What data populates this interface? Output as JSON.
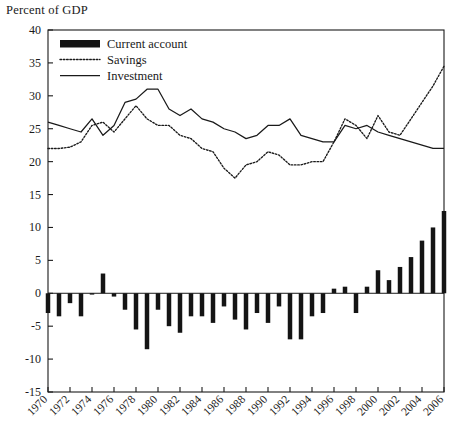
{
  "axis_label": "Percent of GDP",
  "caption": "",
  "legend": {
    "items": [
      {
        "label": "Current account",
        "marker": "bar-swatch"
      },
      {
        "label": "Savings",
        "marker": "dotted-line"
      },
      {
        "label": "Investment",
        "marker": "solid-line"
      }
    ]
  },
  "chart_data": {
    "type": "bar",
    "title": "",
    "subtitle": "",
    "xlabel": "",
    "ylabel": "Percent of GDP",
    "ylim": [
      -15,
      40
    ],
    "ytick_step": 5,
    "yticks": [
      -15,
      -10,
      -5,
      0,
      5,
      10,
      15,
      20,
      25,
      30,
      35,
      40
    ],
    "ytick_labels": [
      "-15",
      "-10",
      "-5",
      "0",
      "5",
      "10",
      "15",
      "20",
      "25",
      "30",
      "35",
      "40"
    ],
    "xlim": [
      1970,
      2006
    ],
    "x": [
      1970,
      1971,
      1972,
      1973,
      1974,
      1975,
      1976,
      1977,
      1978,
      1979,
      1980,
      1981,
      1982,
      1983,
      1984,
      1985,
      1986,
      1987,
      1988,
      1989,
      1990,
      1991,
      1992,
      1993,
      1994,
      1995,
      1996,
      1997,
      1998,
      1999,
      2000,
      2001,
      2002,
      2003,
      2004,
      2005,
      2006
    ],
    "xticks": [
      1970,
      1972,
      1974,
      1976,
      1978,
      1980,
      1982,
      1984,
      1986,
      1988,
      1990,
      1992,
      1994,
      1996,
      1998,
      2000,
      2002,
      2004,
      2006
    ],
    "xtick_labels": [
      "1970",
      "1972",
      "1974",
      "1976",
      "1978",
      "1980",
      "1982",
      "1984",
      "1986",
      "1988",
      "1990",
      "1992",
      "1994",
      "1996",
      "1998",
      "2000",
      "2002",
      "2004",
      "2006"
    ],
    "xtick_rotation": 45,
    "grid": false,
    "legend_position": "upper-left",
    "series": [
      {
        "name": "Current account",
        "type": "bar",
        "color": "#141414",
        "values": [
          -3.0,
          -3.5,
          -1.5,
          -3.5,
          -0.2,
          3.0,
          -0.5,
          -2.5,
          -5.5,
          -8.5,
          -2.5,
          -5.0,
          -6.0,
          -3.5,
          -3.5,
          -4.5,
          -2.0,
          -4.0,
          -5.5,
          -3.0,
          -4.5,
          -2.0,
          -7.0,
          -7.0,
          -3.5,
          -3.0,
          0.7,
          1.0,
          -3.0,
          1.0,
          3.5,
          2.0,
          4.0,
          5.5,
          8.0,
          10.0,
          12.5
        ]
      },
      {
        "name": "Savings",
        "type": "line",
        "style": "dotted",
        "color": "#1a1a1a",
        "values": [
          22.0,
          22.0,
          22.2,
          23.0,
          25.5,
          26.0,
          24.5,
          26.5,
          28.5,
          26.5,
          25.5,
          25.5,
          24.0,
          23.5,
          22.0,
          21.5,
          19.0,
          17.5,
          19.5,
          20.0,
          21.5,
          21.0,
          19.5,
          19.5,
          20.0,
          20.0,
          23.0,
          26.5,
          25.5,
          23.5,
          27.0,
          24.5,
          24.0,
          26.5,
          29.0,
          31.5,
          34.5
        ]
      },
      {
        "name": "Investment",
        "type": "line",
        "style": "solid",
        "color": "#1a1a1a",
        "values": [
          26.0,
          25.5,
          25.0,
          24.5,
          26.5,
          24.0,
          25.5,
          29.0,
          29.5,
          31.0,
          31.0,
          28.0,
          27.0,
          28.0,
          26.5,
          26.0,
          25.0,
          24.5,
          23.5,
          24.0,
          25.5,
          25.5,
          26.5,
          24.0,
          23.5,
          23.0,
          23.0,
          25.5,
          25.0,
          25.5,
          24.5,
          24.0,
          23.5,
          23.0,
          22.5,
          22.0,
          22.0
        ]
      }
    ]
  }
}
